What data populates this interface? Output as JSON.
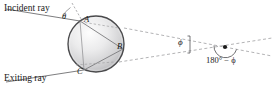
{
  "figure": {
    "kind": "optics-ray-diagram",
    "background_color": "#ffffff",
    "ray_color": "#6e6e70",
    "dash_color": "#9a9a9c",
    "sphere_outline_color": "#4a4a4c",
    "sphere_fill_light": "#f2f2f2",
    "sphere_fill_dark": "#b9b9bb",
    "text_color": "#1a1a1a"
  },
  "labels": {
    "incident_ray": "Incident ray",
    "exiting_ray": "Exiting ray",
    "theta": "θ",
    "point_a": "A",
    "point_b": "B",
    "point_c": "C",
    "phi": "ϕ",
    "supplement_angle": "180° − ϕ"
  },
  "geometry": {
    "sphere": {
      "cx": 96,
      "cy": 44,
      "r": 28
    },
    "point_a": {
      "x": 80,
      "y": 21
    },
    "point_b": {
      "x": 123,
      "y": 49
    },
    "point_c": {
      "x": 84,
      "y": 70
    },
    "vertex": {
      "x": 225,
      "y": 48
    },
    "phi_bracket": {
      "x": 190,
      "y_top": 37,
      "y_bottom": 53
    }
  }
}
